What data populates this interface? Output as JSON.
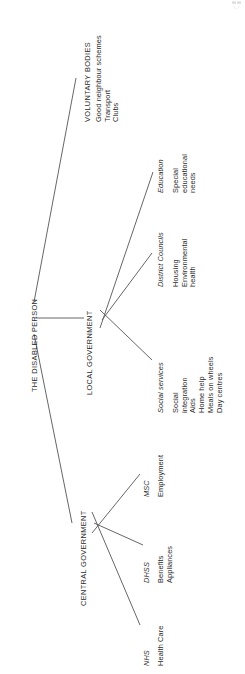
{
  "diagram": {
    "type": "tree",
    "orientation": "rotated-90-ccw",
    "root": {
      "label": "THE DISABLED PERSON"
    },
    "branches": [
      {
        "id": "voluntary-bodies",
        "label": "VOLUNTARY BODIES",
        "agencies": [
          {
            "id": "voluntary-services",
            "name": "",
            "services": [
              "Good neighbour schemes",
              "Transport",
              "Clubs"
            ]
          }
        ]
      },
      {
        "id": "local-government",
        "label": "LOCAL GOVERNMENT",
        "agencies": [
          {
            "id": "social-services",
            "name": "Social services",
            "services": [
              "Social",
              "integration",
              "Aids",
              "Home help",
              "Meals on wheels",
              "Day centres"
            ]
          },
          {
            "id": "district-councils",
            "name": "District Councils",
            "services": [
              "Housing",
              "Environmental",
              "health"
            ]
          },
          {
            "id": "education",
            "name": "Education",
            "services": [
              "Special",
              "educational",
              "needs"
            ]
          }
        ]
      },
      {
        "id": "central-government",
        "label": "CENTRAL GOVERNMENT",
        "agencies": [
          {
            "id": "nhs",
            "name": "NHS",
            "services": [
              "Health Care"
            ]
          },
          {
            "id": "dhss",
            "name": "DHSS",
            "services": [
              "Benefits",
              "Appliances"
            ]
          },
          {
            "id": "msc",
            "name": "MSC",
            "services": [
              "Employment"
            ]
          }
        ]
      }
    ],
    "colors": {
      "line": "#555555",
      "text": "#2b2b2b",
      "background": "#ffffff"
    }
  }
}
